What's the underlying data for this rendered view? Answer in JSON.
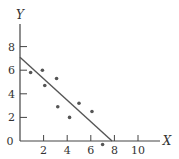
{
  "chart_data": {
    "type": "scatter",
    "title": "",
    "xlabel": "X",
    "ylabel": "Y",
    "xlim": [
      0,
      11.5
    ],
    "ylim": [
      0,
      10
    ],
    "grid": false,
    "x_ticks": [
      2,
      4,
      6,
      8,
      10
    ],
    "y_ticks": [
      2,
      4,
      6,
      8
    ],
    "origin_label": "0",
    "points": [
      {
        "x": 0.9,
        "y": 5.8
      },
      {
        "x": 1.9,
        "y": 6.0
      },
      {
        "x": 2.1,
        "y": 4.7
      },
      {
        "x": 3.1,
        "y": 5.3
      },
      {
        "x": 3.2,
        "y": 2.9
      },
      {
        "x": 4.2,
        "y": 2.0
      },
      {
        "x": 5.0,
        "y": 3.2
      },
      {
        "x": 6.1,
        "y": 2.5
      },
      {
        "x": 7.0,
        "y": -0.3
      }
    ],
    "fit_line": {
      "x1": 0,
      "y1": 7.1,
      "x2": 7.8,
      "y2": 0
    },
    "colors": {
      "axis": "#444444",
      "points": "#555555",
      "line": "#555555"
    }
  }
}
